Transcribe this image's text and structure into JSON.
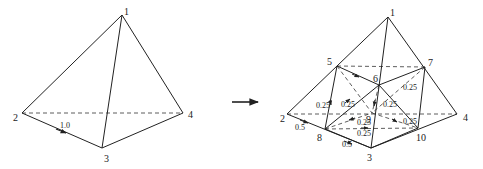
{
  "figure": {
    "left_tetrahedron": {
      "vertices": [
        {
          "id": "1",
          "label": "1",
          "x": 122,
          "y": 15,
          "lx": 124,
          "ly": 15
        },
        {
          "id": "2",
          "label": "2",
          "x": 22,
          "y": 113,
          "lx": 13,
          "ly": 121
        },
        {
          "id": "3",
          "label": "3",
          "x": 102,
          "y": 148,
          "lx": 104,
          "ly": 162
        },
        {
          "id": "4",
          "label": "4",
          "x": 183,
          "y": 113,
          "lx": 188,
          "ly": 118
        }
      ],
      "solid_edges": [
        [
          "1",
          "2"
        ],
        [
          "1",
          "3"
        ],
        [
          "1",
          "4"
        ],
        [
          "2",
          "3"
        ],
        [
          "3",
          "4"
        ]
      ],
      "dashed_edges": [
        [
          "2",
          "4"
        ]
      ],
      "weights": [
        {
          "label": "1.0",
          "x": 60,
          "y": 128,
          "arrow": {
            "x1": 56,
            "y1": 129,
            "x2": 66,
            "y2": 133
          }
        }
      ]
    },
    "transition_arrow": {
      "x1": 232,
      "y1": 102,
      "x2": 258,
      "y2": 102
    },
    "right_tetrahedron": {
      "vertices": [
        {
          "id": "1",
          "label": "1",
          "x": 388,
          "y": 17,
          "lx": 390,
          "ly": 16
        },
        {
          "id": "2",
          "label": "2",
          "x": 287,
          "y": 114,
          "lx": 280,
          "ly": 122
        },
        {
          "id": "3",
          "label": "3",
          "x": 371,
          "y": 148,
          "lx": 367,
          "ly": 161
        },
        {
          "id": "4",
          "label": "4",
          "x": 457,
          "y": 114,
          "lx": 463,
          "ly": 121
        },
        {
          "id": "5",
          "label": "5",
          "x": 337,
          "y": 66,
          "lx": 327,
          "ly": 65
        },
        {
          "id": "6",
          "label": "6",
          "x": 379,
          "y": 85,
          "lx": 373,
          "ly": 82
        },
        {
          "id": "7",
          "label": "7",
          "x": 425,
          "y": 67,
          "lx": 428,
          "ly": 66
        },
        {
          "id": "8",
          "label": "8",
          "x": 325,
          "y": 129,
          "lx": 317,
          "ly": 141
        },
        {
          "id": "9",
          "label": "9",
          "x": 372,
          "y": 113,
          "lx": 366,
          "ly": 123
        },
        {
          "id": "10",
          "label": "10",
          "x": 418,
          "y": 128,
          "lx": 416,
          "ly": 141
        }
      ],
      "solid_edges": [
        [
          "1",
          "2"
        ],
        [
          "1",
          "3"
        ],
        [
          "1",
          "4"
        ],
        [
          "2",
          "3"
        ],
        [
          "3",
          "4"
        ],
        [
          "5",
          "8"
        ],
        [
          "7",
          "10"
        ],
        [
          "5",
          "6"
        ],
        [
          "6",
          "7"
        ],
        [
          "6",
          "8"
        ],
        [
          "6",
          "10"
        ],
        [
          "8",
          "3"
        ],
        [
          "10",
          "3"
        ]
      ],
      "dashed_edges": [
        [
          "2",
          "4"
        ],
        [
          "5",
          "7"
        ],
        [
          "5",
          "9"
        ],
        [
          "7",
          "9"
        ],
        [
          "8",
          "9"
        ],
        [
          "9",
          "10"
        ],
        [
          "8",
          "10"
        ],
        [
          "6",
          "9"
        ]
      ],
      "weights": [
        {
          "label": "0.5",
          "x": 295,
          "y": 130
        },
        {
          "label": "0.5",
          "x": 342,
          "y": 147
        },
        {
          "label": "0.25",
          "x": 316,
          "y": 108
        },
        {
          "label": "0.25",
          "x": 341,
          "y": 107
        },
        {
          "label": "0.25",
          "x": 357,
          "y": 125
        },
        {
          "label": "0.25",
          "x": 357,
          "y": 136
        },
        {
          "label": "0.25",
          "x": 383,
          "y": 107
        },
        {
          "label": "0.25",
          "x": 403,
          "y": 124
        },
        {
          "label": "0.25",
          "x": 403,
          "y": 90
        }
      ],
      "arrows": [
        {
          "x1": 300,
          "y1": 120,
          "x2": 308,
          "y2": 123
        },
        {
          "x1": 344,
          "y1": 141,
          "x2": 352,
          "y2": 144
        },
        {
          "x1": 330,
          "y1": 100,
          "x2": 331,
          "y2": 105
        },
        {
          "x1": 352,
          "y1": 74,
          "x2": 359,
          "y2": 77
        },
        {
          "x1": 345,
          "y1": 103,
          "x2": 350,
          "y2": 99
        },
        {
          "x1": 355,
          "y1": 118,
          "x2": 349,
          "y2": 120
        },
        {
          "x1": 361,
          "y1": 128,
          "x2": 368,
          "y2": 128
        },
        {
          "x1": 375,
          "y1": 100,
          "x2": 374,
          "y2": 106
        },
        {
          "x1": 392,
          "y1": 119,
          "x2": 397,
          "y2": 122
        }
      ]
    }
  }
}
